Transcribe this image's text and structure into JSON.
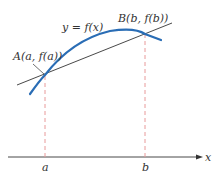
{
  "diagram": {
    "curve_label": "y = f(x)",
    "point_a_label": "A(a, f(a))",
    "point_b_label": "B(b, f(b))",
    "axis_label": "x",
    "tick_a_label": "a",
    "tick_b_label": "b"
  },
  "colors": {
    "curve": "#2a6db5",
    "secant": "#333333",
    "dashed": "#e89a9a",
    "axis": "#333333"
  }
}
